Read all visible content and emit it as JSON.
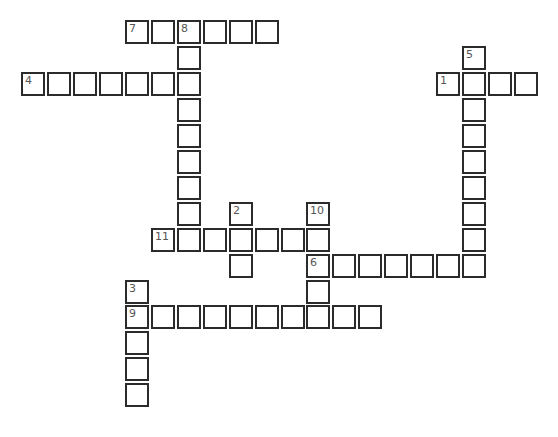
{
  "puzzle": {
    "grid": {
      "origin_x": 21,
      "origin_y": 20,
      "pitch": 25.95
    },
    "words": [
      {
        "number": "7",
        "direction": "across",
        "row": 0,
        "col": 4,
        "length": 6
      },
      {
        "number": "8",
        "direction": "down",
        "row": 0,
        "col": 6,
        "length": 9
      },
      {
        "number": "4",
        "direction": "across",
        "row": 2,
        "col": 0,
        "length": 7
      },
      {
        "number": "5",
        "direction": "down",
        "row": 1,
        "col": 17,
        "length": 9
      },
      {
        "number": "1",
        "direction": "across",
        "row": 2,
        "col": 16,
        "length": 4
      },
      {
        "number": "2",
        "direction": "down",
        "row": 7,
        "col": 8,
        "length": 3
      },
      {
        "number": "10",
        "direction": "down",
        "row": 7,
        "col": 11,
        "length": 5
      },
      {
        "number": "11",
        "direction": "across",
        "row": 8,
        "col": 5,
        "length": 7
      },
      {
        "number": "6",
        "direction": "across",
        "row": 9,
        "col": 11,
        "length": 7
      },
      {
        "number": "3",
        "direction": "down",
        "row": 10,
        "col": 4,
        "length": 5
      },
      {
        "number": "9",
        "direction": "across",
        "row": 11,
        "col": 4,
        "length": 10
      }
    ],
    "colors": {
      "border": "#2b2b2b",
      "cell_bg": "#ffffff",
      "number": "#555555"
    }
  }
}
